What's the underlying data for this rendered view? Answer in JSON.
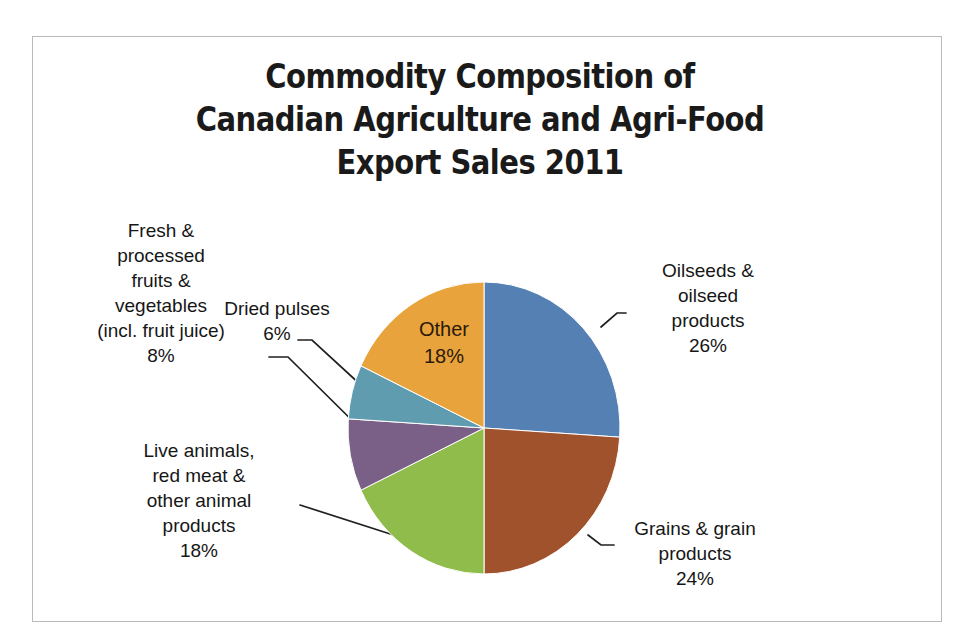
{
  "chart_title": "Commodity Composition of\nCanadian Agriculture and Agri-Food\nExport Sales 2011",
  "labels": {
    "oilseeds": "Oilseeds &\noilseed\nproducts\n26%",
    "grains": "Grains & grain\nproducts\n24%",
    "animals": "Live animals,\nred meat &\nother animal\nproducts\n18%",
    "fruits": "Fresh &\nprocessed\nfruits &\nvegetables\n(incl. fruit juice)\n8%",
    "pulses": "Dried pulses\n6%",
    "other": "Other\n18%"
  },
  "chart_data": {
    "type": "pie",
    "title": "Commodity Composition of Canadian Agriculture and Agri-Food Export Sales 2011",
    "xlabel": "",
    "ylabel": "",
    "legend": "none",
    "grid": false,
    "start_angle_deg": 0,
    "direction": "clockwise",
    "categories": [
      "Oilseeds & oilseed products",
      "Grains & grain products",
      "Live animals, red meat & other animal products",
      "Fresh & processed fruits & vegetables (incl. fruit juice)",
      "Dried pulses",
      "Other"
    ],
    "values": [
      26,
      24,
      18,
      8,
      6,
      18
    ],
    "value_labels": [
      "26%",
      "24%",
      "18%",
      "8%",
      "6%",
      "18%"
    ],
    "unit": "percent",
    "total": 100,
    "colors": [
      "#5580b3",
      "#a0522d",
      "#8fbc4a",
      "#7a5f86",
      "#5f9cb0",
      "#e8a33d"
    ],
    "slices": [
      {
        "name": "Oilseeds & oilseed products",
        "value": 26,
        "label": "26%",
        "color": "#5580b3",
        "label_placement": "outside-right"
      },
      {
        "name": "Grains & grain products",
        "value": 24,
        "label": "24%",
        "color": "#a0522d",
        "label_placement": "outside-right"
      },
      {
        "name": "Live animals, red meat & other animal products",
        "value": 18,
        "label": "18%",
        "color": "#8fbc4a",
        "label_placement": "outside-left"
      },
      {
        "name": "Fresh & processed fruits & vegetables (incl. fruit juice)",
        "value": 8,
        "label": "8%",
        "color": "#7a5f86",
        "label_placement": "outside-left"
      },
      {
        "name": "Dried pulses",
        "value": 6,
        "label": "6%",
        "color": "#5f9cb0",
        "label_placement": "outside-left"
      },
      {
        "name": "Other",
        "value": 18,
        "label": "18%",
        "color": "#e8a33d",
        "label_placement": "inside"
      }
    ]
  }
}
